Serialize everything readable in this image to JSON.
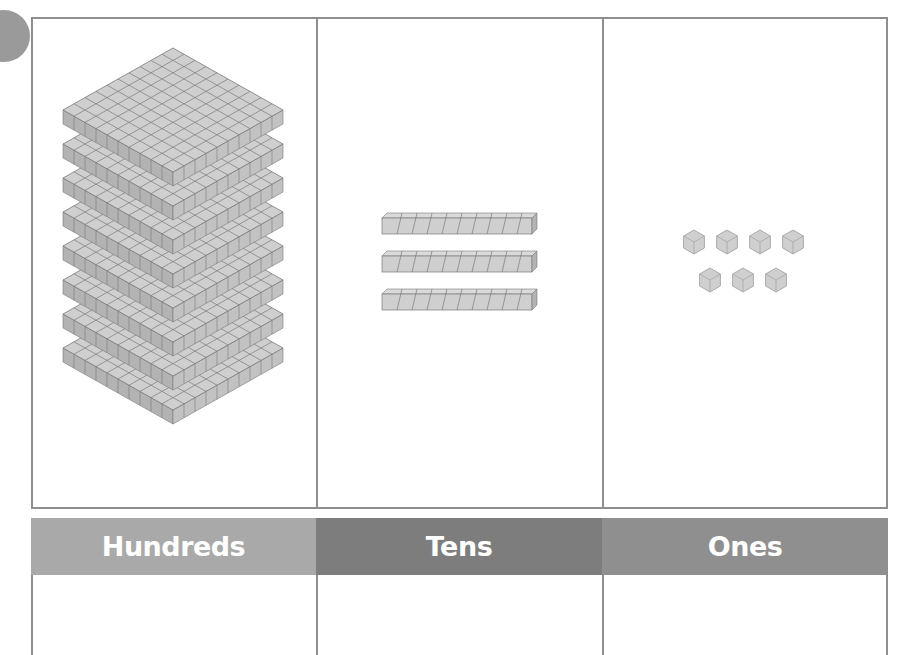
{
  "badge": {
    "shape": "circle",
    "color": "#9a9a9a"
  },
  "place_value_chart": {
    "columns": [
      {
        "key": "hundreds",
        "label": "Hundreds",
        "header_color": "#a9a9a9",
        "block_type": "hundreds-flat",
        "block_count": 8,
        "answer": ""
      },
      {
        "key": "tens",
        "label": "Tens",
        "header_color": "#7d7d7d",
        "block_type": "tens-rod",
        "block_count": 3,
        "answer": ""
      },
      {
        "key": "ones",
        "label": "Ones",
        "header_color": "#8f8f8f",
        "block_type": "ones-cube",
        "block_count": 7,
        "answer": ""
      }
    ]
  },
  "colors": {
    "border": "#8e8e8e",
    "block_face": "#cfcfcf",
    "block_side": "#b3b3b3",
    "block_line": "#7a7a7a",
    "header_text": "#ffffff"
  }
}
